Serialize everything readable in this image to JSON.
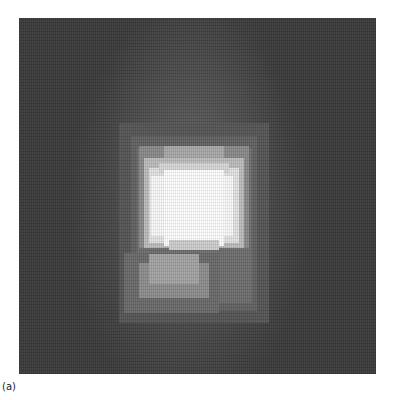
{
  "figure": {
    "label": "(a)",
    "background_color": "#3a3a3a",
    "blocks": [
      {
        "x": 100,
        "y": 105,
        "w": 150,
        "h": 200,
        "c": "#555555"
      },
      {
        "x": 112,
        "y": 118,
        "w": 126,
        "h": 175,
        "c": "#626262"
      },
      {
        "x": 118,
        "y": 130,
        "w": 115,
        "h": 155,
        "c": "#6e6e6e"
      },
      {
        "x": 105,
        "y": 235,
        "w": 95,
        "h": 60,
        "c": "#6a6a6a"
      },
      {
        "x": 120,
        "y": 128,
        "w": 110,
        "h": 102,
        "c": "#8a8a8a"
      },
      {
        "x": 120,
        "y": 245,
        "w": 70,
        "h": 35,
        "c": "#8e8e8e"
      },
      {
        "x": 130,
        "y": 236,
        "w": 50,
        "h": 30,
        "c": "#a4a4a4"
      },
      {
        "x": 125,
        "y": 140,
        "w": 100,
        "h": 90,
        "c": "#bdbdbd"
      },
      {
        "x": 145,
        "y": 128,
        "w": 60,
        "h": 12,
        "c": "#a9a9a9"
      },
      {
        "x": 130,
        "y": 150,
        "w": 90,
        "h": 75,
        "c": "#e4e4e4"
      },
      {
        "x": 140,
        "y": 145,
        "w": 70,
        "h": 10,
        "c": "#d8d8d8"
      },
      {
        "x": 132,
        "y": 158,
        "w": 82,
        "h": 60,
        "c": "#fafafa"
      },
      {
        "x": 145,
        "y": 152,
        "w": 60,
        "h": 76,
        "c": "#ffffff"
      },
      {
        "x": 150,
        "y": 222,
        "w": 50,
        "h": 10,
        "c": "#cfcfcf"
      }
    ]
  }
}
